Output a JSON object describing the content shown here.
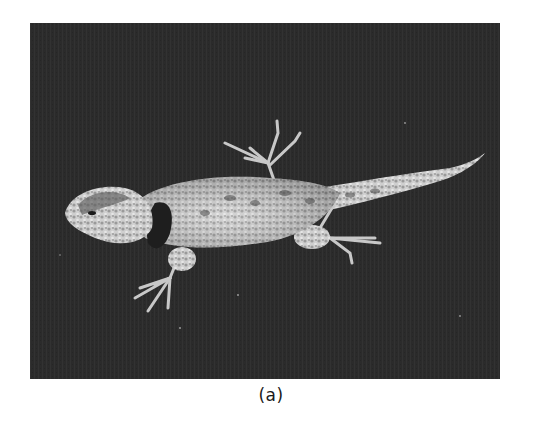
{
  "figure": {
    "caption": "(a)",
    "photo": {
      "subject": "spiny lizard, top-down view, on dark background",
      "style": "black-and-white halftone photograph",
      "colors": {
        "background": "#2a2a2a",
        "body_light": "#d8d8d8",
        "body_mid": "#a8a8a8",
        "markings_dark": "#3a3a3a",
        "collar": "#1e1e1e"
      }
    }
  }
}
